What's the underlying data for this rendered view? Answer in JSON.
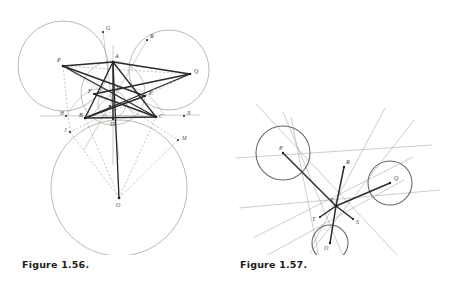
{
  "page": {
    "width": 456,
    "height": 287,
    "background": "#ffffff",
    "kind": "geometry-figures"
  },
  "figures": [
    {
      "id": "figure-1-56",
      "caption": "Figure 1.56.",
      "caption_pos": {
        "x": 22,
        "y": 264
      },
      "colors": {
        "circle_stroke": "#9b9186",
        "thin_line": "#8d8d8d",
        "dashed_line": "#9a9a9a",
        "bold_line": "#2b2b2b",
        "point": "#1f1f1f",
        "label": "#3a3a3a"
      },
      "circles": [
        {
          "name": "circle-P",
          "cx": 63,
          "cy": 66,
          "r": 45
        },
        {
          "name": "circle-Q",
          "cx": 169,
          "cy": 70,
          "r": 40
        },
        {
          "name": "circle-O",
          "cx": 119,
          "cy": 188,
          "r": 68
        },
        {
          "name": "circumcircle-ABC",
          "cx": 113,
          "cy": 93,
          "r": 32
        },
        {
          "name": "incircle-ABC",
          "cx": 112,
          "cy": 104,
          "r": 14
        }
      ],
      "points": [
        {
          "label": "P",
          "x": 63,
          "y": 66,
          "lx": 58,
          "ly": 62
        },
        {
          "label": "Q",
          "x": 190,
          "y": 74,
          "lx": 194,
          "ly": 71
        },
        {
          "label": "O",
          "x": 119,
          "y": 198,
          "lx": 117,
          "ly": 205
        },
        {
          "label": "A",
          "x": 113,
          "y": 62,
          "lx": 115,
          "ly": 58
        },
        {
          "label": "B",
          "x": 85,
          "y": 118,
          "lx": 81,
          "ly": 116
        },
        {
          "label": "C",
          "x": 156,
          "y": 117,
          "lx": 159,
          "ly": 117
        },
        {
          "label": "D",
          "x": 113,
          "y": 119,
          "lx": 110,
          "ly": 124
        },
        {
          "label": "E",
          "x": 145,
          "y": 96,
          "lx": 148,
          "ly": 94
        },
        {
          "label": "F",
          "x": 94,
          "y": 94,
          "lx": 90,
          "ly": 93
        },
        {
          "label": "G",
          "x": 103,
          "y": 32,
          "lx": 106,
          "ly": 29
        },
        {
          "label": "R",
          "x": 147,
          "y": 40,
          "lx": 150,
          "ly": 37
        },
        {
          "label": "H",
          "x": 66,
          "y": 116,
          "lx": 61,
          "ly": 114
        },
        {
          "label": "N",
          "x": 184,
          "y": 116,
          "lx": 186,
          "ly": 114
        },
        {
          "label": "J",
          "x": 70,
          "y": 132,
          "lx": 65,
          "ly": 131
        },
        {
          "label": "M",
          "x": 178,
          "y": 140,
          "lx": 182,
          "ly": 139
        },
        {
          "label": "Y",
          "x": 114,
          "y": 90,
          "lx": 116,
          "ly": 89
        },
        {
          "label": "X",
          "x": 108,
          "y": 108,
          "lx": 105,
          "ly": 110
        }
      ],
      "bold_segments": [
        [
          "P",
          "A"
        ],
        [
          "P",
          "C"
        ],
        [
          "P",
          "E"
        ],
        [
          "Q",
          "A"
        ],
        [
          "Q",
          "B"
        ],
        [
          "Q",
          "F"
        ],
        [
          "A",
          "B"
        ],
        [
          "B",
          "C"
        ],
        [
          "C",
          "A"
        ],
        [
          "A",
          "D"
        ],
        [
          "B",
          "E"
        ],
        [
          "C",
          "F"
        ],
        [
          "O",
          "A"
        ],
        [
          "B",
          "X"
        ],
        [
          "C",
          "X"
        ]
      ],
      "dashed_segments": [
        [
          "P",
          "Q"
        ],
        [
          "P",
          "J"
        ],
        [
          "P",
          "M"
        ],
        [
          "Q",
          "J"
        ],
        [
          "Q",
          "B"
        ],
        [
          "O",
          "J"
        ],
        [
          "O",
          "M"
        ],
        [
          "O",
          "B"
        ],
        [
          "O",
          "C"
        ],
        [
          "B",
          "M"
        ],
        [
          "C",
          "J"
        ]
      ],
      "thin_lines": [
        [
          "G",
          "D"
        ],
        [
          "R",
          "B"
        ],
        [
          "H",
          "N"
        ],
        [
          "A",
          "O"
        ]
      ]
    },
    {
      "id": "figure-1-57",
      "caption": "Figure 1.57.",
      "caption_pos": {
        "x": 240,
        "y": 264
      },
      "colors": {
        "circle_stroke": "#807a72",
        "thin_line": "#9b9b9b",
        "bold_line": "#2b2b2b",
        "point": "#1f1f1f",
        "label": "#3a3a3a"
      },
      "circles": [
        {
          "name": "circle-P",
          "cx": 283,
          "cy": 153,
          "r": 27
        },
        {
          "name": "circle-Q",
          "cx": 390,
          "cy": 183,
          "r": 22
        },
        {
          "name": "circle-O",
          "cx": 330,
          "cy": 243,
          "r": 18
        }
      ],
      "points": [
        {
          "label": "P",
          "x": 283,
          "y": 153,
          "lx": 281,
          "ly": 150
        },
        {
          "label": "Q",
          "x": 390,
          "y": 183,
          "lx": 393,
          "ly": 180
        },
        {
          "label": "R",
          "x": 344,
          "y": 167,
          "lx": 346,
          "ly": 165
        },
        {
          "label": "O",
          "x": 330,
          "y": 243,
          "lx": 325,
          "ly": 246
        },
        {
          "label": "X",
          "x": 336,
          "y": 206,
          "lx": 332,
          "ly": 202
        },
        {
          "label": "S",
          "x": 353,
          "y": 219,
          "lx": 356,
          "ly": 222
        },
        {
          "label": "T",
          "x": 320,
          "y": 217,
          "lx": 314,
          "ly": 219
        }
      ],
      "bold_segments": [
        [
          "P",
          "X"
        ],
        [
          "Q",
          "X"
        ],
        [
          "R",
          "X"
        ],
        [
          "O",
          "X"
        ],
        [
          "X",
          "S"
        ],
        [
          "X",
          "T"
        ]
      ]
    }
  ]
}
